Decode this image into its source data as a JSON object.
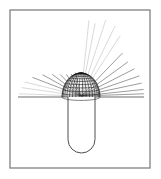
{
  "figure": {
    "title": "",
    "caption": "",
    "background_color": "#ffffff",
    "frame": {
      "name": "figure-border",
      "x": 10,
      "y": 10,
      "width": 140,
      "height": 158,
      "stroke_color": "#8a8a8a",
      "stroke_width": 1.4,
      "fill": "#ffffff"
    },
    "ground_line": {
      "name": "horizontal-baseline",
      "x1": 18,
      "x2": 144,
      "y": 97,
      "stroke_color": "#2b2b2b",
      "stroke_width": 0.7
    },
    "dome": {
      "name": "hemispherical-mesh-dome",
      "center_x": 81,
      "base_y": 97,
      "radius_x": 19,
      "radius_y": 24,
      "stroke_color": "#111111",
      "stroke_width": 0.55,
      "meridian_count": 17,
      "parallel_count": 9,
      "description": "hemispherical wireframe mesh"
    },
    "body": {
      "name": "capsule-body",
      "left_x": 68,
      "right_x": 95,
      "top_y": 97,
      "bottom_y": 153,
      "corner_radius": 13.5,
      "stroke_color": "#3a3a3a",
      "stroke_width": 0.9,
      "fill": "#ffffff",
      "description": "U-shaped rounded-bottom vessel"
    },
    "rays": {
      "name": "radiating-ray-bundle",
      "origin_x": 81,
      "origin_y": 96,
      "stroke_color_dark": "#4a4a4a",
      "stroke_color_light": "#b9b9b9",
      "stroke_width": 0.55,
      "upper_rays": [
        {
          "angle_deg": 84,
          "length": 76,
          "shade": "light"
        },
        {
          "angle_deg": 79,
          "length": 74,
          "shade": "light"
        },
        {
          "angle_deg": 72,
          "length": 80,
          "shade": "light"
        },
        {
          "angle_deg": 64,
          "length": 78,
          "shade": "light"
        },
        {
          "angle_deg": 57,
          "length": 72,
          "shade": "light"
        }
      ],
      "right_rays": [
        {
          "angle_deg": 46,
          "length": 60,
          "shade": "dark"
        },
        {
          "angle_deg": 36,
          "length": 58,
          "shade": "dark"
        },
        {
          "angle_deg": 27,
          "length": 60,
          "shade": "dark"
        },
        {
          "angle_deg": 19,
          "length": 62,
          "shade": "dark"
        },
        {
          "angle_deg": 12,
          "length": 62,
          "shade": "dark"
        },
        {
          "angle_deg": 6,
          "length": 63,
          "shade": "dark"
        },
        {
          "angle_deg": 2,
          "length": 63,
          "shade": "dark"
        }
      ],
      "left_rays": [
        {
          "angle_deg": 178,
          "length": 62,
          "shade": "light"
        },
        {
          "angle_deg": 172,
          "length": 60,
          "shade": "light"
        },
        {
          "angle_deg": 166,
          "length": 58,
          "shade": "light"
        },
        {
          "angle_deg": 159,
          "length": 52,
          "shade": "dark"
        },
        {
          "angle_deg": 151,
          "length": 44,
          "shade": "dark"
        },
        {
          "angle_deg": 143,
          "length": 36,
          "shade": "dark"
        },
        {
          "angle_deg": 134,
          "length": 30,
          "shade": "dark"
        },
        {
          "angle_deg": 124,
          "length": 26,
          "shade": "dark"
        },
        {
          "angle_deg": 114,
          "length": 24,
          "shade": "dark"
        },
        {
          "angle_deg": 104,
          "length": 24,
          "shade": "dark"
        }
      ]
    }
  }
}
